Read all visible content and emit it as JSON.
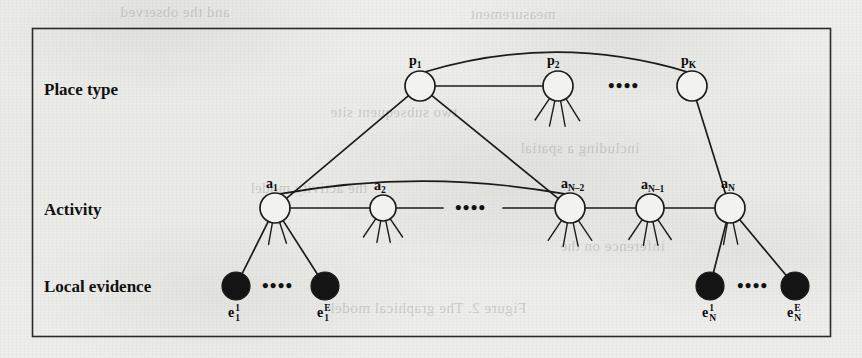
{
  "figure": {
    "kind": "graphical-model-diagram",
    "background_color": "#ececea",
    "ink_color": "#1a1a1a",
    "frame": {
      "x": 32,
      "y": 28,
      "width": 798,
      "height": 308
    },
    "row_labels": [
      {
        "name": "place-type",
        "text": "Place type",
        "x": 44,
        "y": 80
      },
      {
        "name": "activity",
        "text": "Activity",
        "x": 44,
        "y": 200
      },
      {
        "name": "local-evidence",
        "text": "Local evidence",
        "x": 44,
        "y": 277
      }
    ],
    "ellipsis_marks": [
      {
        "name": "place-row-ellipsis",
        "text": "••••",
        "x": 608,
        "y": 76
      },
      {
        "name": "activity-row-ellipsis",
        "text": "••••",
        "x": 455,
        "y": 198
      },
      {
        "name": "evidence-left-ellipsis",
        "text": "••••",
        "x": 262,
        "y": 276
      },
      {
        "name": "evidence-right-ellipsis",
        "text": "••••",
        "x": 737,
        "y": 276
      }
    ],
    "place_nodes": [
      {
        "name": "place-node-p1",
        "id": "p1",
        "base": "p",
        "sub": "1",
        "cx": 420,
        "cy": 86,
        "r": 15
      },
      {
        "name": "place-node-p2",
        "id": "p2",
        "base": "p",
        "sub": "2",
        "cx": 558,
        "cy": 86,
        "r": 15
      },
      {
        "name": "place-node-pk",
        "id": "pK",
        "base": "p",
        "sub": "K",
        "cx": 692,
        "cy": 86,
        "r": 15
      }
    ],
    "activity_nodes": [
      {
        "name": "activity-node-a1",
        "id": "a1",
        "base": "a",
        "sub": "1",
        "cx": 275,
        "cy": 208,
        "r": 15
      },
      {
        "name": "activity-node-a2",
        "id": "a2",
        "base": "a",
        "sub": "2",
        "cx": 383,
        "cy": 208,
        "r": 13
      },
      {
        "name": "activity-node-aN-2",
        "id": "aN-2",
        "base": "a",
        "sub": "N–2",
        "cx": 570,
        "cy": 208,
        "r": 15
      },
      {
        "name": "activity-node-aN-1",
        "id": "aN-1",
        "base": "a",
        "sub": "N–1",
        "cx": 650,
        "cy": 208,
        "r": 14
      },
      {
        "name": "activity-node-aN",
        "id": "aN",
        "base": "a",
        "sub": "N",
        "cx": 730,
        "cy": 208,
        "r": 15
      }
    ],
    "evidence_nodes": [
      {
        "name": "evidence-node-e1-1",
        "id": "e1_1",
        "base": "e",
        "sup": "1",
        "sub": "1",
        "cx": 236,
        "cy": 286,
        "r": 14
      },
      {
        "name": "evidence-node-e1-E",
        "id": "e1_E",
        "base": "e",
        "sup": "E",
        "sub": "1",
        "cx": 325,
        "cy": 286,
        "r": 14
      },
      {
        "name": "evidence-node-eN-1",
        "id": "eN_1",
        "base": "e",
        "sup": "1",
        "sub": "N",
        "cx": 710,
        "cy": 286,
        "r": 14
      },
      {
        "name": "evidence-node-eN-E",
        "id": "eN_E",
        "base": "e",
        "sup": "E",
        "sub": "N",
        "cx": 795,
        "cy": 286,
        "r": 14
      }
    ],
    "edges": [
      {
        "name": "edge-p1-p2",
        "from": "p1",
        "to": "p2",
        "type": "line"
      },
      {
        "name": "edge-p1-pK-arc",
        "from": "p1",
        "to": "pK",
        "type": "arc"
      },
      {
        "name": "edge-p1-a1",
        "from": "p1",
        "to": "a1",
        "type": "line"
      },
      {
        "name": "edge-p1-aN-2",
        "from": "p1",
        "to": "aN-2",
        "type": "line"
      },
      {
        "name": "edge-pK-aN",
        "from": "pK",
        "to": "aN",
        "type": "line"
      },
      {
        "name": "edge-a1-a2",
        "from": "a1",
        "to": "a2",
        "type": "line"
      },
      {
        "name": "edge-a2-dots",
        "from": "a2",
        "to": "ellipsis",
        "type": "line"
      },
      {
        "name": "edge-dots-aN-2",
        "from": "ellipsis",
        "to": "aN-2",
        "type": "line"
      },
      {
        "name": "edge-aN-2-aN-1",
        "from": "aN-2",
        "to": "aN-1",
        "type": "line"
      },
      {
        "name": "edge-aN-1-aN",
        "from": "aN-1",
        "to": "aN",
        "type": "line"
      },
      {
        "name": "edge-a1-aN-2-arc",
        "from": "a1",
        "to": "aN-2",
        "type": "arc"
      },
      {
        "name": "edge-a1-e1-1",
        "from": "a1",
        "to": "e1_1",
        "type": "line"
      },
      {
        "name": "edge-a1-e1-E",
        "from": "a1",
        "to": "e1_E",
        "type": "line"
      },
      {
        "name": "edge-aN-eN-1",
        "from": "aN",
        "to": "eN_1",
        "type": "line"
      },
      {
        "name": "edge-aN-eN-E",
        "from": "aN",
        "to": "eN_E",
        "type": "line"
      }
    ],
    "bleed_through_text": [
      {
        "text": "and the observed",
        "x": 120,
        "y": 4
      },
      {
        "text": "measurement",
        "x": 470,
        "y": 6
      },
      {
        "text": "two subsequent site",
        "x": 330,
        "y": 104
      },
      {
        "text": "including a spatial",
        "x": 520,
        "y": 140
      },
      {
        "text": "the activity model",
        "x": 250,
        "y": 180
      },
      {
        "text": "inference on the",
        "x": 560,
        "y": 238
      },
      {
        "text": "Figure 2. The graphical model",
        "x": 330,
        "y": 300
      }
    ]
  }
}
